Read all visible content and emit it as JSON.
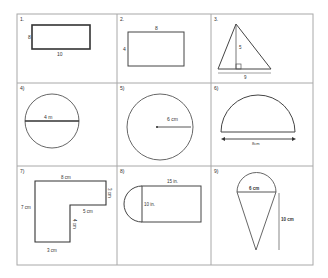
{
  "worksheet": {
    "problems": [
      {
        "number": "1.",
        "shape": "rectangle",
        "labels": {
          "height": "8",
          "width": "10"
        }
      },
      {
        "number": "2.",
        "shape": "rectangle",
        "labels": {
          "width": "8",
          "height": "4"
        }
      },
      {
        "number": "3.",
        "shape": "triangle",
        "labels": {
          "height": "5",
          "base": "9"
        }
      },
      {
        "number": "4)",
        "shape": "circle-diameter",
        "labels": {
          "diameter": "4 m"
        }
      },
      {
        "number": "5)",
        "shape": "circle-radius",
        "labels": {
          "radius": "6 cm"
        }
      },
      {
        "number": "6)",
        "shape": "semicircle",
        "labels": {
          "diameter": "8cm"
        }
      },
      {
        "number": "7)",
        "shape": "l-shape",
        "labels": {
          "top": "8 cm",
          "right": "3 cm",
          "left": "7 cm",
          "inner_horizontal": "5 cm",
          "inner_vertical": "4 cm",
          "bottom": "3 cm"
        }
      },
      {
        "number": "8)",
        "shape": "rectangle-with-semicircle",
        "labels": {
          "length": "15 in.",
          "height": "10 in."
        }
      },
      {
        "number": "9)",
        "shape": "cone-with-semicircle",
        "labels": {
          "diameter": "6 cm",
          "height": "10 cm"
        }
      }
    ]
  },
  "colors": {
    "grid_line": "#a8a8a8",
    "shape_stroke": "#333333",
    "thin_stroke": "#777777"
  }
}
